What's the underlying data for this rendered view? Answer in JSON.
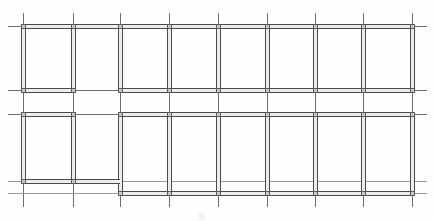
{
  "drawing": {
    "title": "Structural framing plan",
    "description": "Two-story structural framing plan: thick double-line beams/walls laid over thin dashed column grid axes. Upper band of bays, an open middle corridor band, and a lower band of bays that steps down on the right portion.",
    "caption_text": "图",
    "caption_note": "",
    "colors": {
      "background": "#ffffff",
      "gridline": "#6e6e6e",
      "gridline_faint": "#9a9a9a",
      "wall_stroke": "#4a4a4a",
      "wall_fill": "#ededed",
      "column_fill": "#c9c9c9",
      "caption_text": "#e9e9e9"
    },
    "extent": {
      "width": 434,
      "height": 221
    },
    "grid": {
      "vertical_axes_x": [
        23,
        73,
        120,
        169,
        218,
        267,
        315,
        363,
        412
      ],
      "horizontal_axes_y": [
        26,
        90,
        114,
        181,
        193
      ],
      "vertical_axis_top": 13,
      "vertical_axis_bottom": 207,
      "horizontal_axis_left": 8,
      "horizontal_axis_right": 427,
      "column_count": 9,
      "row_count": 5
    },
    "bands": {
      "upper_row": {
        "y_top": 26,
        "y_bottom": 90
      },
      "middle_corridor": {
        "y_top": 90,
        "y_bottom": 114
      },
      "lower_row_left": {
        "y_top": 114,
        "y_bottom": 181
      },
      "lower_row_right": {
        "y_top": 114,
        "y_bottom": 193
      }
    },
    "walls": {
      "vertical": [
        {
          "x": 23,
          "y1": 26,
          "y2": 90,
          "name": "wall-v-a-upper"
        },
        {
          "x": 73,
          "y1": 26,
          "y2": 90,
          "name": "wall-v-b-upper"
        },
        {
          "x": 120,
          "y1": 26,
          "y2": 90,
          "name": "wall-v-c-upper"
        },
        {
          "x": 169,
          "y1": 26,
          "y2": 90,
          "name": "wall-v-d-upper"
        },
        {
          "x": 218,
          "y1": 26,
          "y2": 90,
          "name": "wall-v-e-upper"
        },
        {
          "x": 267,
          "y1": 26,
          "y2": 90,
          "name": "wall-v-f-upper"
        },
        {
          "x": 315,
          "y1": 26,
          "y2": 90,
          "name": "wall-v-g-upper"
        },
        {
          "x": 363,
          "y1": 26,
          "y2": 90,
          "name": "wall-v-h-upper"
        },
        {
          "x": 412,
          "y1": 26,
          "y2": 90,
          "name": "wall-v-i-upper"
        },
        {
          "x": 23,
          "y1": 114,
          "y2": 181,
          "name": "wall-v-a-lower"
        },
        {
          "x": 73,
          "y1": 114,
          "y2": 181,
          "name": "wall-v-b-lower"
        },
        {
          "x": 120,
          "y1": 114,
          "y2": 193,
          "name": "wall-v-c-lower"
        },
        {
          "x": 169,
          "y1": 114,
          "y2": 193,
          "name": "wall-v-d-lower"
        },
        {
          "x": 218,
          "y1": 114,
          "y2": 193,
          "name": "wall-v-e-lower"
        },
        {
          "x": 267,
          "y1": 114,
          "y2": 193,
          "name": "wall-v-f-lower"
        },
        {
          "x": 315,
          "y1": 114,
          "y2": 193,
          "name": "wall-v-g-lower"
        },
        {
          "x": 363,
          "y1": 114,
          "y2": 193,
          "name": "wall-v-h-lower"
        },
        {
          "x": 412,
          "y1": 114,
          "y2": 193,
          "name": "wall-v-i-lower"
        }
      ],
      "horizontal": [
        {
          "y": 26,
          "x1": 23,
          "x2": 412,
          "name": "wall-h-top"
        },
        {
          "y": 90,
          "x1": 23,
          "x2": 73,
          "name": "wall-h-mid-left"
        },
        {
          "y": 90,
          "x1": 120,
          "x2": 412,
          "name": "wall-h-mid-right"
        },
        {
          "y": 114,
          "x1": 23,
          "x2": 73,
          "name": "wall-h-corridor-left"
        },
        {
          "y": 114,
          "x1": 120,
          "x2": 412,
          "name": "wall-h-corridor-right"
        },
        {
          "y": 181,
          "x1": 23,
          "x2": 120,
          "name": "wall-h-bottom-left"
        },
        {
          "y": 193,
          "x1": 120,
          "x2": 412,
          "name": "wall-h-bottom-right"
        }
      ]
    }
  }
}
